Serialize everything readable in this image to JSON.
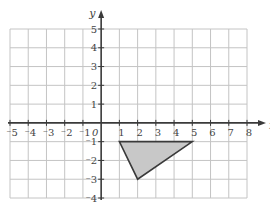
{
  "chart_data": {
    "type": "coordinate-grid",
    "title": "",
    "xlabel": "x",
    "ylabel": "y",
    "xlim": [
      -5,
      8
    ],
    "ylim": [
      -4,
      5
    ],
    "grid": true,
    "x_ticks": [
      "-5",
      "-4",
      "-3",
      "-2",
      "-1",
      "1",
      "2",
      "3",
      "4",
      "5",
      "6",
      "7",
      "8"
    ],
    "y_ticks": [
      "5",
      "4",
      "3",
      "2",
      "1",
      "-1",
      "-2",
      "-3",
      "-4"
    ],
    "origin_label": "0",
    "shapes": [
      {
        "name": "triangle",
        "vertices": [
          [
            1,
            -1
          ],
          [
            5,
            -1
          ],
          [
            2,
            -3
          ]
        ],
        "fill": "#c8c8c8",
        "stroke": "#3a3a3a"
      }
    ]
  },
  "colors": {
    "grid": "#c4c4c4",
    "axis": "#3a3a3a",
    "label": "#444444",
    "fill": "#c8c8c8"
  }
}
